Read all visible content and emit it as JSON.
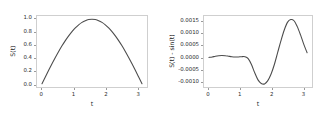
{
  "figure": {
    "background_color": "#ffffff",
    "line_color": "#4c4c4c",
    "axis_color": "#cfcfcf"
  },
  "chart_data": [
    {
      "type": "line",
      "panel": "left",
      "title": "",
      "xlabel": "t",
      "ylabel": "S(t)",
      "xlim": [
        -0.157,
        3.299
      ],
      "ylim": [
        -0.05,
        1.05
      ],
      "xticks": [
        "0",
        "1",
        "2",
        "3"
      ],
      "xtick_values": [
        0,
        1,
        2,
        3
      ],
      "yticks": [
        "0.0",
        "0.2",
        "0.4",
        "0.6",
        "0.8",
        "1.0"
      ],
      "ytick_values": [
        0.0,
        0.2,
        0.4,
        0.6,
        0.8,
        1.0
      ],
      "grid": false,
      "legend": null,
      "series": [
        {
          "name": "S(t)",
          "x": [
            0.0,
            0.1047,
            0.2094,
            0.3142,
            0.4189,
            0.5236,
            0.6283,
            0.733,
            0.8378,
            0.9425,
            1.0472,
            1.1519,
            1.2566,
            1.3614,
            1.4661,
            1.5708,
            1.6755,
            1.7802,
            1.885,
            1.9897,
            2.0944,
            2.1991,
            2.3038,
            2.4086,
            2.5133,
            2.618,
            2.7227,
            2.8274,
            2.9322,
            3.0369,
            3.1416
          ],
          "y": [
            0.0,
            0.1045,
            0.2079,
            0.309,
            0.4067,
            0.5,
            0.5878,
            0.6691,
            0.7431,
            0.809,
            0.866,
            0.9135,
            0.9511,
            0.9781,
            0.9945,
            1.0,
            0.9945,
            0.9781,
            0.9511,
            0.9135,
            0.866,
            0.809,
            0.7431,
            0.6691,
            0.5878,
            0.5,
            0.4067,
            0.309,
            0.2079,
            0.1045,
            0.0
          ]
        }
      ]
    },
    {
      "type": "line",
      "panel": "right",
      "title": "",
      "xlabel": "t",
      "ylabel": "S(t) - sin(t)",
      "xlim": [
        -0.157,
        3.299
      ],
      "ylim": [
        -0.00125,
        0.00175
      ],
      "xticks": [
        "0",
        "1",
        "2",
        "3"
      ],
      "xtick_values": [
        0,
        1,
        2,
        3
      ],
      "yticks": [
        "-0.0010",
        "-0.0005",
        "0.0000",
        "0.0005",
        "0.0010",
        "0.0015"
      ],
      "ytick_values": [
        -0.001,
        -0.0005,
        0.0,
        0.0005,
        0.001,
        0.0015
      ],
      "grid": false,
      "legend": null,
      "series": [
        {
          "name": "S(t) - sin(t)",
          "x": [
            0.0,
            0.1047,
            0.2094,
            0.3142,
            0.4189,
            0.5236,
            0.6283,
            0.733,
            0.8378,
            0.9425,
            1.0472,
            1.1519,
            1.2566,
            1.3614,
            1.4661,
            1.5708,
            1.6755,
            1.7802,
            1.885,
            1.9897,
            2.0944,
            2.1991,
            2.3038,
            2.4086,
            2.5133,
            2.618,
            2.7227,
            2.8274,
            2.9322,
            3.0369,
            3.1416
          ],
          "y": [
            0.0,
            2e-05,
            5e-05,
            7e-05,
            8e-05,
            7e-05,
            5e-05,
            3e-05,
            2e-05,
            2e-05,
            3e-05,
            3e-05,
            -5e-05,
            -0.0003,
            -0.00065,
            -0.00095,
            -0.0011,
            -0.00112,
            -0.00098,
            -0.0007,
            -0.0003,
            0.0002,
            0.0007,
            0.00115,
            0.00148,
            0.0016,
            0.00155,
            0.0013,
            0.00095,
            0.00055,
            0.0002
          ]
        }
      ]
    }
  ]
}
